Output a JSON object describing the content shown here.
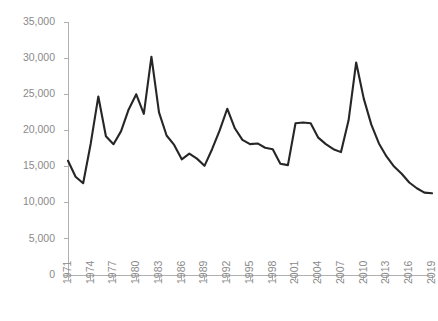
{
  "chart_data": {
    "type": "line",
    "title": "",
    "subtitle": "",
    "xlabel": "",
    "ylabel": "",
    "grid": false,
    "legend": false,
    "legend_position": "none",
    "line_color": "#262626",
    "axis_color": "#b0b0b0",
    "tick_label_color": "#8a8a8a",
    "xlim": [
      1971,
      2019
    ],
    "ylim": [
      0,
      35000
    ],
    "ytick_step": 5000,
    "ytick_values": [
      0,
      5000,
      10000,
      15000,
      20000,
      25000,
      30000,
      35000
    ],
    "ytick_labels": [
      "0",
      "5,000",
      "10,000",
      "15,000",
      "20,000",
      "25,000",
      "30,000",
      "35,000"
    ],
    "xtick_step": 3,
    "xtick_values": [
      1971,
      1974,
      1977,
      1980,
      1983,
      1986,
      1989,
      1992,
      1995,
      1998,
      2001,
      2004,
      2007,
      2010,
      2013,
      2016,
      2019
    ],
    "xtick_labels": [
      "1971",
      "1974",
      "1977",
      "1980",
      "1983",
      "1986",
      "1989",
      "1992",
      "1995",
      "1998",
      "2001",
      "2004",
      "2007",
      "2010",
      "2013",
      "2016",
      "2019"
    ],
    "xtick_label_rotation": -90,
    "x": [
      1971,
      1972,
      1973,
      1974,
      1975,
      1976,
      1977,
      1978,
      1979,
      1980,
      1981,
      1982,
      1983,
      1984,
      1985,
      1986,
      1987,
      1988,
      1989,
      1990,
      1991,
      1992,
      1993,
      1994,
      1995,
      1996,
      1997,
      1998,
      1999,
      2000,
      2001,
      2002,
      2003,
      2004,
      2005,
      2006,
      2007,
      2008,
      2009,
      2010,
      2011,
      2012,
      2013,
      2014,
      2015,
      2016,
      2017,
      2018,
      2019
    ],
    "values": [
      15800,
      13600,
      12700,
      18200,
      24700,
      19200,
      18100,
      19900,
      22900,
      25000,
      22300,
      30200,
      22500,
      19300,
      18000,
      16000,
      16800,
      16100,
      15100,
      17400,
      20000,
      23000,
      20300,
      18700,
      18100,
      18200,
      17600,
      17400,
      15400,
      15200,
      21000,
      21100,
      21000,
      19000,
      18100,
      17400,
      17000,
      21400,
      29400,
      24400,
      20800,
      18200,
      16400,
      15000,
      14000,
      12800,
      12000,
      11400,
      11300
    ],
    "series": [
      {
        "name": "",
        "values": [
          15800,
          13600,
          12700,
          18200,
          24700,
          19200,
          18100,
          19900,
          22900,
          25000,
          22300,
          30200,
          22500,
          19300,
          18000,
          16000,
          16800,
          16100,
          15100,
          17400,
          20000,
          23000,
          20300,
          18700,
          18100,
          18200,
          17600,
          17400,
          15400,
          15200,
          21000,
          21100,
          21000,
          19000,
          18100,
          17400,
          17000,
          21400,
          29400,
          24400,
          20800,
          18200,
          16400,
          15000,
          14000,
          12800,
          12000,
          11400,
          11300
        ]
      }
    ],
    "annotations": [],
    "notes": {
      "max_value": 30200,
      "max_year": 1982,
      "min_value": 11300,
      "min_year": 2019,
      "secondary_peak_value": 29400,
      "secondary_peak_year": 2009
    }
  },
  "plot_geometry": {
    "left": 68,
    "right": 432,
    "top": 22,
    "bottom": 275
  }
}
